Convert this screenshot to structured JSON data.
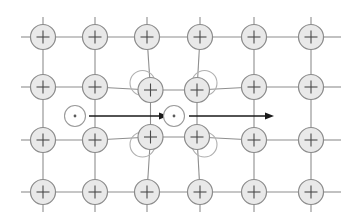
{
  "figure": {
    "background_color": "#ffffff",
    "width": 342,
    "height": 215
  },
  "style": {
    "ion_fill": "#e9e9e9",
    "ion_stroke": "#8a8a8a",
    "ion_stroke_width": 1.2,
    "ion_radius": 12.5,
    "ion_sign_color": "#4a4a4a",
    "ghost_fill": "none",
    "ghost_stroke": "#b0b0b0",
    "ghost_stroke_width": 1.1,
    "bond_color": "#8e8e8e",
    "bond_width": 1.1,
    "electron_fill": "#ffffff",
    "electron_stroke": "#9a9a9a",
    "electron_stroke_width": 1.1,
    "electron_radius": 10.5,
    "electron_dot_color": "#5a5a5a",
    "electron_dot_radius": 1.4,
    "arrow_color": "#1a1a1a",
    "arrow_width": 1.5
  },
  "lattice": {
    "label": "ion lattice grid",
    "columns": 6,
    "rows": 4,
    "column_x": [
      43,
      95,
      147,
      200,
      254,
      311
    ],
    "row_y": [
      37,
      87,
      140,
      192
    ],
    "ion_label": "+",
    "ion_charge_name": "positive-ion",
    "bond_extension_left": 22,
    "bond_extension_right": 30
  },
  "displaced_ions": {
    "label": "ions displaced toward second electron",
    "description": "Four lattice ions around the second electron are pulled inward; a ghost outline marks the undisplaced position.",
    "items": [
      {
        "name": "displaced-ion-top-left",
        "col": 2,
        "row": 1,
        "dx": 3.5,
        "dy": 3.0,
        "ghost_dx": -4.5,
        "ghost_dy": -4.0
      },
      {
        "name": "displaced-ion-top-right",
        "col": 3,
        "row": 1,
        "dx": -3.0,
        "dy": 3.0,
        "ghost_dx": 4.5,
        "ghost_dy": -4.0
      },
      {
        "name": "displaced-ion-bottom-left",
        "col": 2,
        "row": 2,
        "dx": 3.5,
        "dy": -3.0,
        "ghost_dx": -4.5,
        "ghost_dy": 4.5
      },
      {
        "name": "displaced-ion-bottom-right",
        "col": 3,
        "row": 2,
        "dx": -3.0,
        "dy": -3.0,
        "ghost_dx": 4.5,
        "ghost_dy": 4.5
      }
    ]
  },
  "electrons": {
    "label": "conduction electrons",
    "sign_label": "·",
    "items": [
      {
        "name": "electron-leading",
        "x": 75,
        "y": 116
      },
      {
        "name": "electron-trailing",
        "x": 174,
        "y": 116
      }
    ]
  },
  "arrows": {
    "label": "electron motion direction arrows",
    "direction": "right",
    "items": [
      {
        "name": "motion-arrow-first",
        "x1": 89,
        "y1": 116,
        "x2": 168,
        "y2": 116
      },
      {
        "name": "motion-arrow-second",
        "x1": 189,
        "y1": 116,
        "x2": 274,
        "y2": 116
      }
    ],
    "head_length": 9,
    "head_width": 7
  }
}
